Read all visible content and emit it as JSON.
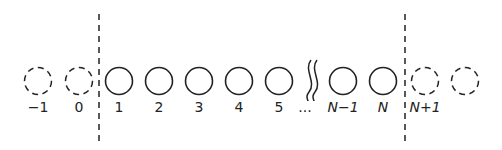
{
  "diagram": {
    "colors": {
      "stroke": "#222222",
      "background": "#ffffff"
    },
    "ghost_sites_left": [
      {
        "label": "−1",
        "cx": 38
      },
      {
        "label": "0",
        "cx": 79
      }
    ],
    "real_sites": [
      {
        "label": "1",
        "cx": 119
      },
      {
        "label": "2",
        "cx": 159
      },
      {
        "label": "3",
        "cx": 199
      },
      {
        "label": "4",
        "cx": 239
      },
      {
        "label": "5",
        "cx": 279
      },
      {
        "label": "N−1",
        "cx": 343
      },
      {
        "label": "N",
        "cx": 383
      }
    ],
    "ellipsis_label": "...",
    "ghost_sites_right": [
      {
        "label": "N+1",
        "cx": 425
      },
      {
        "label": "",
        "cx": 465
      }
    ],
    "boundaries": [
      {
        "x": 99
      },
      {
        "x": 405
      }
    ]
  }
}
